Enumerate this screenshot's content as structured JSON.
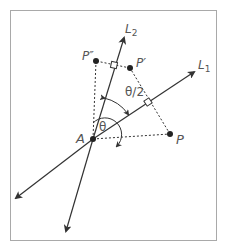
{
  "diagram": {
    "title": "",
    "lines": [
      {
        "id": "L1",
        "label": "L",
        "subscript": "1"
      },
      {
        "id": "L2",
        "label": "L",
        "subscript": "2"
      }
    ],
    "points": [
      {
        "id": "A",
        "label": "A"
      },
      {
        "id": "P",
        "label": "P"
      },
      {
        "id": "P_prime",
        "label": "P′"
      },
      {
        "id": "P_double_prime",
        "label": "P″"
      }
    ],
    "angles": [
      {
        "id": "theta",
        "label": "θ"
      },
      {
        "id": "half_theta",
        "label": "θ/2"
      }
    ],
    "colors": {
      "line": "#333333",
      "frame": "#a9a9a9",
      "label": "#555555"
    }
  }
}
